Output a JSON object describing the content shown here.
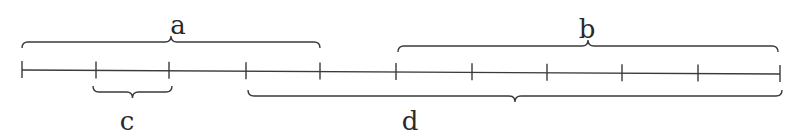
{
  "diagram": {
    "type": "number-line-segments",
    "line": {
      "x_start": 22,
      "x_end": 780,
      "y_start": 70,
      "y_end": 74,
      "color": "#3a3a3a"
    },
    "ticks": [
      22,
      96,
      169,
      246,
      320,
      396,
      472,
      547,
      622,
      698,
      780
    ],
    "segments": [
      {
        "label": "a",
        "side": "above",
        "from_tick": 0,
        "to_tick": 4,
        "x1": 22,
        "x2": 320,
        "y": 42,
        "label_x": 178,
        "label_y": 12
      },
      {
        "label": "b",
        "side": "above",
        "from_tick": 5,
        "to_tick": 10,
        "x1": 398,
        "x2": 778,
        "y": 46,
        "label_x": 587,
        "label_y": 16
      },
      {
        "label": "c",
        "side": "below",
        "from_tick": 1,
        "to_tick": 2,
        "x1": 93,
        "x2": 172,
        "y": 92,
        "label_x": 127,
        "label_y": 108
      },
      {
        "label": "d",
        "side": "below",
        "from_tick": 3,
        "to_tick": 10,
        "x1": 248,
        "x2": 782,
        "y": 96,
        "label_x": 410,
        "label_y": 108
      }
    ]
  }
}
